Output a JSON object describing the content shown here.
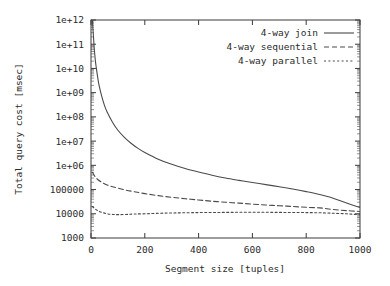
{
  "chart_data": {
    "type": "line",
    "title": "",
    "xlabel": "Segment size [tuples]",
    "ylabel": "Total query cost [msec]",
    "xlim": [
      0,
      1000
    ],
    "ylim": [
      1000,
      1000000000000
    ],
    "yscale": "log",
    "xscale": "linear",
    "grid": false,
    "legend_position": "top-right",
    "xticks": [
      "0",
      "200",
      "400",
      "600",
      "800",
      "1000"
    ],
    "xtick_values": [
      0,
      200,
      400,
      600,
      800,
      1000
    ],
    "yticks": [
      "1000",
      "10000",
      "100000",
      "1e+06",
      "1e+07",
      "1e+08",
      "1e+09",
      "1e+10",
      "1e+11",
      "1e+12"
    ],
    "ytick_values": [
      1000,
      10000,
      100000,
      1000000,
      10000000,
      100000000,
      1000000000,
      10000000000,
      100000000000,
      1000000000000
    ],
    "series": [
      {
        "name": "4-way join",
        "style": "solid",
        "x": [
          5,
          8,
          12,
          16,
          20,
          25,
          30,
          40,
          50,
          60,
          80,
          100,
          125,
          150,
          175,
          200,
          250,
          300,
          350,
          400,
          450,
          500,
          550,
          600,
          650,
          700,
          750,
          800,
          850,
          900,
          950,
          1000
        ],
        "values": [
          1000000000000.0,
          320000000000.0,
          70000000000.0,
          22000000000.0,
          10000000000.0,
          4200000000.0,
          2000000000.0,
          700000000.0,
          300000000.0,
          160000000.0,
          60000000.0,
          28000000.0,
          14000000.0,
          8000000.0,
          5000000.0,
          3400000.0,
          1800000.0,
          1100000.0,
          740000.0,
          530000.0,
          390000.0,
          300000.0,
          240000.0,
          195000.0,
          160000.0,
          130000.0,
          105000.0,
          82000.0,
          62000.0,
          44000.0,
          28000.0,
          18000.0
        ]
      },
      {
        "name": "4-way sequential",
        "style": "dashed",
        "x": [
          5,
          15,
          25,
          40,
          60,
          80,
          100,
          130,
          160,
          200,
          250,
          300,
          350,
          400,
          450,
          500,
          550,
          600,
          650,
          700,
          750,
          800,
          850,
          900,
          950,
          1000
        ],
        "values": [
          520000.0,
          340000.0,
          260000.0,
          200000.0,
          155000.0,
          130000.0,
          115000.0,
          95000.0,
          82000.0,
          68000.0,
          56000.0,
          48000.0,
          42000.0,
          37000.0,
          33000.0,
          30000.0,
          27500.0,
          25000.0,
          23000.0,
          21500.0,
          20000.0,
          18500.0,
          17500.0,
          15000.0,
          13500.0,
          12500.0
        ]
      },
      {
        "name": "4-way parallel",
        "style": "dotted",
        "x": [
          5,
          15,
          25,
          40,
          60,
          80,
          100,
          130,
          160,
          200,
          250,
          300,
          350,
          400,
          450,
          500,
          550,
          600,
          650,
          700,
          750,
          800,
          850,
          900,
          950,
          1000
        ],
        "values": [
          20000.0,
          16000.0,
          13500.0,
          11500.0,
          10000.0,
          9400.0,
          9200.0,
          9400.0,
          9800.0,
          10000.0,
          10500.0,
          10800.0,
          11000.0,
          11200.0,
          11300.0,
          11400.0,
          11500.0,
          11500.0,
          11500.0,
          11400.0,
          11300.0,
          11200.0,
          11000.0,
          10500.0,
          10000.0,
          9000.0
        ]
      }
    ]
  },
  "colors": {
    "background": "#ffffff",
    "axis": "#3a3a3a",
    "line": "#4a4a4a",
    "text": "#2b2b2b"
  }
}
